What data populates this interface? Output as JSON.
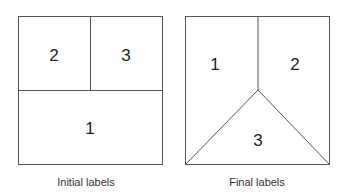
{
  "panels": [
    {
      "caption": "Initial labels",
      "regions": [
        {
          "label": "2"
        },
        {
          "label": "3"
        },
        {
          "label": "1"
        }
      ]
    },
    {
      "caption": "Final labels",
      "regions": [
        {
          "label": "1"
        },
        {
          "label": "2"
        },
        {
          "label": "3"
        }
      ]
    }
  ],
  "colors": {
    "stroke": "#555555",
    "text": "#222222"
  }
}
